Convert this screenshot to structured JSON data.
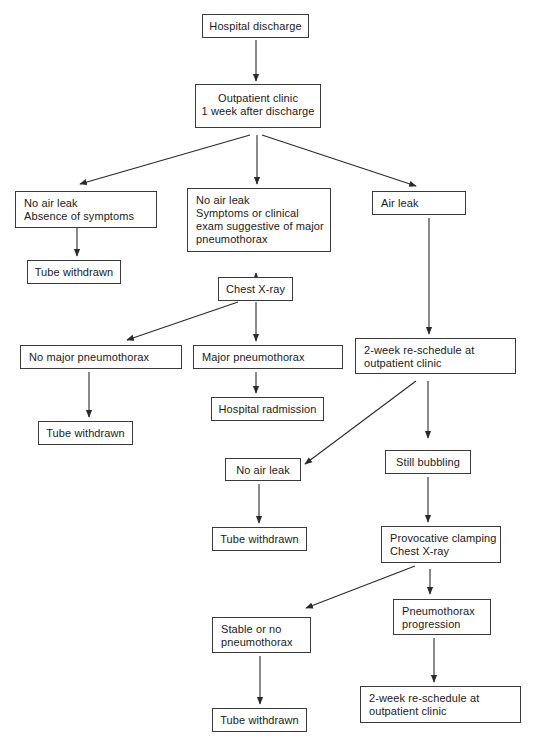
{
  "diagram": {
    "type": "flowchart",
    "nodes": {
      "hospital_discharge": {
        "lines": [
          "Hospital discharge"
        ]
      },
      "outpatient_clinic": {
        "lines": [
          "Outpatient clinic",
          "1 week after discharge"
        ]
      },
      "no_air_leak_no_symptoms": {
        "lines": [
          "No air leak",
          "Absence of symptoms"
        ]
      },
      "no_air_leak_symptoms": {
        "lines": [
          "No air leak",
          "Symptoms or clinical",
          "exam suggestive of major",
          "pneumothorax"
        ]
      },
      "air_leak": {
        "lines": [
          "Air leak"
        ]
      },
      "tube_withdrawn_1": {
        "lines": [
          "Tube withdrawn"
        ]
      },
      "chest_xray": {
        "lines": [
          "Chest X-ray"
        ]
      },
      "no_major_pneumothorax": {
        "lines": [
          "No major pneumothorax"
        ]
      },
      "major_pneumothorax": {
        "lines": [
          "Major pneumothorax"
        ]
      },
      "reschedule_1": {
        "lines": [
          "2-week re-schedule at",
          "outpatient clinic"
        ]
      },
      "hospital_readmission": {
        "lines": [
          "Hospital radmission"
        ]
      },
      "tube_withdrawn_2": {
        "lines": [
          "Tube withdrawn"
        ]
      },
      "no_air_leak_2": {
        "lines": [
          "No air leak"
        ]
      },
      "still_bubbling": {
        "lines": [
          "Still bubbling"
        ]
      },
      "tube_withdrawn_3": {
        "lines": [
          "Tube withdrawn"
        ]
      },
      "provocative_clamping": {
        "lines": [
          "Provocative clamping",
          "Chest X-ray"
        ]
      },
      "stable_or_no_pneumothorax": {
        "lines": [
          "Stable or no",
          "pneumothorax"
        ]
      },
      "pneumothorax_progression": {
        "lines": [
          "Pneumothorax",
          "progression"
        ]
      },
      "reschedule_2": {
        "lines": [
          "2-week re-schedule at",
          "outpatient clinic"
        ]
      },
      "tube_withdrawn_4": {
        "lines": [
          "Tube withdrawn"
        ]
      }
    },
    "edges": [
      [
        "hospital_discharge",
        "outpatient_clinic"
      ],
      [
        "outpatient_clinic",
        "no_air_leak_no_symptoms"
      ],
      [
        "outpatient_clinic",
        "no_air_leak_symptoms"
      ],
      [
        "outpatient_clinic",
        "air_leak"
      ],
      [
        "no_air_leak_no_symptoms",
        "tube_withdrawn_1"
      ],
      [
        "no_air_leak_symptoms",
        "chest_xray"
      ],
      [
        "chest_xray",
        "no_major_pneumothorax"
      ],
      [
        "chest_xray",
        "major_pneumothorax"
      ],
      [
        "air_leak",
        "reschedule_1"
      ],
      [
        "major_pneumothorax",
        "hospital_readmission"
      ],
      [
        "no_major_pneumothorax",
        "tube_withdrawn_2"
      ],
      [
        "reschedule_1",
        "no_air_leak_2"
      ],
      [
        "reschedule_1",
        "still_bubbling"
      ],
      [
        "no_air_leak_2",
        "tube_withdrawn_3"
      ],
      [
        "still_bubbling",
        "provocative_clamping"
      ],
      [
        "provocative_clamping",
        "stable_or_no_pneumothorax"
      ],
      [
        "provocative_clamping",
        "pneumothorax_progression"
      ],
      [
        "pneumothorax_progression",
        "reschedule_2"
      ],
      [
        "stable_or_no_pneumothorax",
        "tube_withdrawn_4"
      ]
    ]
  },
  "colors": {
    "line": "#2a2a2a",
    "border": "#3a3a3a",
    "background": "#ffffff",
    "text": "#1a1a1a"
  }
}
